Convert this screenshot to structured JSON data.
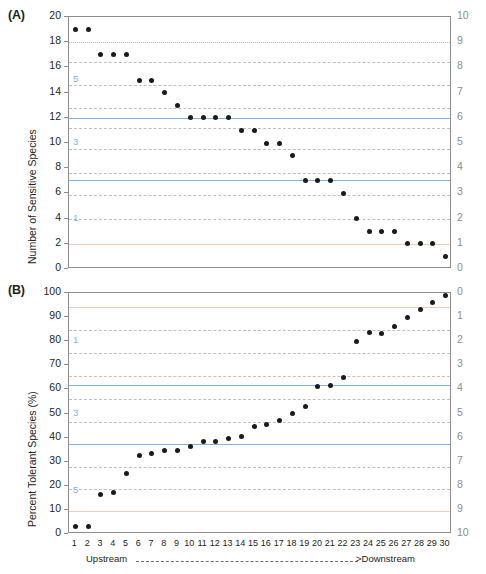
{
  "figure": {
    "xaxis": {
      "upstream_label": "Upstream",
      "downstream_label": ">Downstream",
      "dashes": "-------------------------------------------------------------",
      "ticks": [
        1,
        2,
        3,
        4,
        5,
        6,
        7,
        8,
        9,
        10,
        11,
        12,
        13,
        14,
        15,
        16,
        17,
        18,
        19,
        20,
        21,
        22,
        23,
        24,
        25,
        26,
        27,
        28,
        29,
        30
      ]
    }
  },
  "panelA": {
    "tag": "(A)",
    "ylabel": "Number of Sensitive Species",
    "yticks_left": [
      20,
      18,
      16,
      14,
      12,
      10,
      8,
      6,
      4,
      2,
      0
    ],
    "yticks_right": [
      10,
      9,
      8,
      7,
      6,
      5,
      4,
      3,
      2,
      1,
      0
    ],
    "blue_annotations": [
      {
        "text": "5",
        "value": 15
      },
      {
        "text": "3",
        "value": 10
      },
      {
        "text": "1",
        "value": 4
      }
    ],
    "reference_lines": [
      {
        "value": 18,
        "style": "dot-orange"
      },
      {
        "value": 16.4,
        "style": "dash-gray"
      },
      {
        "value": 14.6,
        "style": "dash-gray"
      },
      {
        "value": 12.8,
        "style": "dash-gray"
      },
      {
        "value": 12.0,
        "style": "solid-blue"
      },
      {
        "value": 11.2,
        "style": "dash-gray"
      },
      {
        "value": 9.5,
        "style": "dash-gray"
      },
      {
        "value": 7.6,
        "style": "dash-gray"
      },
      {
        "value": 7.1,
        "style": "solid-blue"
      },
      {
        "value": 5.9,
        "style": "dash-gray"
      },
      {
        "value": 4.0,
        "style": "dash-gray"
      },
      {
        "value": 2.0,
        "style": "solid-orange"
      }
    ]
  },
  "panelB": {
    "tag": "(B)",
    "ylabel": "Percent Tolerant Species (%)",
    "yticks_left": [
      100,
      90,
      80,
      70,
      60,
      50,
      40,
      30,
      20,
      10,
      0
    ],
    "yticks_right": [
      0,
      1,
      2,
      3,
      4,
      5,
      6,
      7,
      8,
      9,
      10
    ],
    "blue_annotations": [
      {
        "text": "1",
        "value": 80
      },
      {
        "text": "3",
        "value": 50
      },
      {
        "text": "5",
        "value": 18
      }
    ],
    "reference_lines": [
      {
        "value": 94,
        "style": "solid-orange"
      },
      {
        "value": 84.5,
        "style": "dash-gray"
      },
      {
        "value": 75,
        "style": "dash-gray"
      },
      {
        "value": 65.5,
        "style": "dash-orange"
      },
      {
        "value": 62,
        "style": "solid-blue"
      },
      {
        "value": 56,
        "style": "dash-gray"
      },
      {
        "value": 46.5,
        "style": "dash-gray"
      },
      {
        "value": 37.5,
        "style": "solid-blue"
      },
      {
        "value": 28,
        "style": "dash-gray"
      },
      {
        "value": 18.5,
        "style": "dash-gray"
      },
      {
        "value": 9.5,
        "style": "solid-orange"
      }
    ]
  },
  "chart_data": [
    {
      "type": "scatter",
      "title": "(A)",
      "xlabel": "Upstream ------------------------------------>Downstream",
      "ylabel": "Number of Sensitive Species",
      "ylim": [
        0,
        20
      ],
      "xlim": [
        0.5,
        30.5
      ],
      "y2label": "",
      "y2lim": [
        10,
        0
      ],
      "grid": true,
      "legend": "none",
      "x": [
        1,
        2,
        3,
        4,
        5,
        6,
        7,
        8,
        9,
        10,
        11,
        12,
        13,
        14,
        15,
        16,
        17,
        18,
        19,
        20,
        21,
        22,
        23,
        24,
        25,
        26,
        27,
        28,
        29,
        30
      ],
      "values": [
        19,
        19,
        17,
        17,
        17,
        15,
        15,
        14,
        13,
        12,
        12,
        12,
        12,
        11,
        11,
        10,
        10,
        9,
        7,
        7,
        7,
        6,
        4,
        3,
        3,
        3,
        2,
        2,
        2,
        1
      ]
    },
    {
      "type": "scatter",
      "title": "(B)",
      "xlabel": "Upstream ------------------------------------>Downstream",
      "ylabel": "Percent Tolerant Species (%)",
      "ylim": [
        0,
        100
      ],
      "xlim": [
        0.5,
        30.5
      ],
      "y2label": "",
      "y2lim": [
        0,
        10
      ],
      "grid": true,
      "legend": "none",
      "x": [
        1,
        2,
        3,
        4,
        5,
        6,
        7,
        8,
        9,
        10,
        11,
        12,
        13,
        14,
        15,
        16,
        17,
        18,
        19,
        20,
        21,
        22,
        23,
        24,
        25,
        26,
        27,
        28,
        29,
        30
      ],
      "values": [
        3,
        3.2,
        16.5,
        17.2,
        25.2,
        32.5,
        33.5,
        34.5,
        34.5,
        36.5,
        38.5,
        38.5,
        39.5,
        40.5,
        44.5,
        45.5,
        47,
        50,
        53,
        61,
        61.5,
        65,
        80,
        83.5,
        83,
        86,
        90,
        93,
        96,
        99
      ]
    }
  ]
}
